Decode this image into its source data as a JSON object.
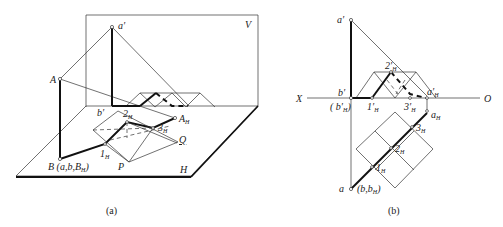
{
  "figure_a": {
    "caption": "(a)",
    "labels": {
      "V": "V",
      "H": "H",
      "a_prime": "a′",
      "A": "A",
      "b_prime": "b′",
      "B": "B (a,b,B",
      "B_sub": "H",
      "B_close": ")",
      "A_H": "A",
      "A_H_sub": "H",
      "one_H": "1",
      "one_H_sub": "H",
      "two_H": "2",
      "two_H_sub": "H",
      "three_H": "3",
      "three_H_sub": "H",
      "P": "P",
      "Q": "Q"
    }
  },
  "figure_b": {
    "caption": "(b)",
    "labels": {
      "X": "X",
      "O": "O",
      "a_prime": "a′",
      "b_prime": "b′",
      "b_prime_H": "( b′",
      "b_prime_H_sub": "H",
      "b_prime_H_close": ")",
      "one_prime": "1′",
      "one_prime_sub": "H",
      "two_prime": "2′",
      "two_prime_sub": "H",
      "three_prime": "3′",
      "three_prime_sub": "H",
      "a_prime_H": "a′",
      "a_prime_H_sub": "H",
      "a_H": "a",
      "a_H_sub": "H",
      "one_h": "1",
      "one_h_sub": "H",
      "two_h": "2",
      "two_h_sub": "H",
      "three_h": "3",
      "three_h_sub": "H",
      "a": "a",
      "b_bH": "(b,b",
      "b_bH_sub": "H",
      "b_bH_close": ")"
    }
  }
}
